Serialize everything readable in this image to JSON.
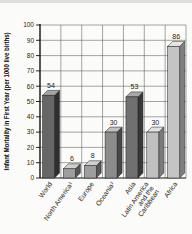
{
  "page": {
    "background": "#fbfbf9",
    "top_edge_band_color": "#dedede"
  },
  "chart_data": {
    "type": "bar",
    "title": "",
    "xlabel": "",
    "ylabel": "Infant Mortality in First Year (per 1000 live births)",
    "ylim": [
      0,
      100
    ],
    "ytick_step": 10,
    "yticks": [
      0,
      10,
      20,
      30,
      40,
      50,
      60,
      70,
      80,
      90,
      100
    ],
    "grid": "both",
    "legend_position": "none",
    "bar_style": "3d-extruded",
    "categories": [
      "World",
      "North America¹",
      "Europe",
      "Oceania²",
      "Asia",
      "Latin America\nand the\nCaribbean",
      "Africa"
    ],
    "values": [
      54,
      6,
      8,
      30,
      53,
      30,
      86
    ],
    "value_labels": [
      "54",
      "6",
      "8",
      "30",
      "53",
      "30",
      "86"
    ],
    "colors": {
      "bar_fronts": [
        "#666666",
        "#9e9e9e",
        "#9e9e9e",
        "#8c8c8c",
        "#707070",
        "#c0c0c0",
        "#c4c4c4"
      ],
      "bar_tops": [
        "#a3a3a3",
        "#d0d0d0",
        "#d0d0d0",
        "#c0c0c0",
        "#a8a8a8",
        "#e2e2e2",
        "#e6e6e6"
      ],
      "bar_sides": [
        "#2f2f2f",
        "#565656",
        "#565656",
        "#474747",
        "#383838",
        "#7a7a7a",
        "#7e7e7e"
      ],
      "bar_outline": "#1f1f1f",
      "grid": "#5a5a5a",
      "axis": "#111111",
      "text": "#1d1d1d"
    }
  }
}
